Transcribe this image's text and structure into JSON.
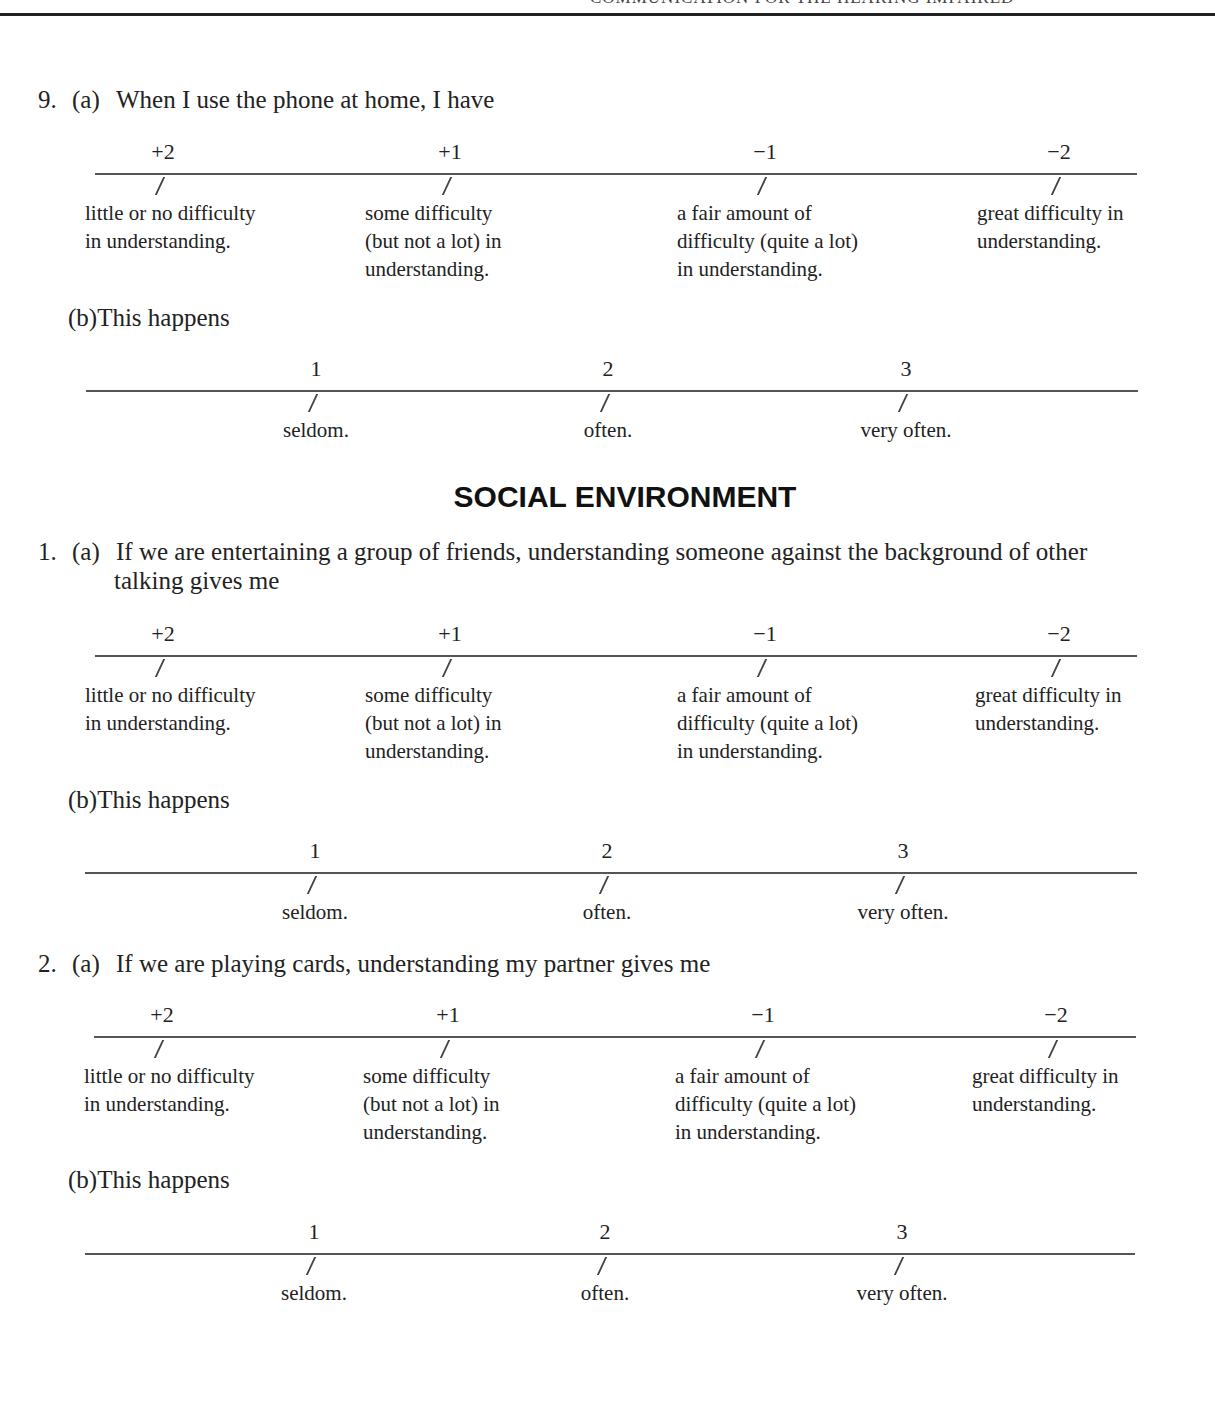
{
  "page": {
    "running_head": "COMMUNICATION FOR THE HEARING IMPAIRED",
    "section_title": "SOCIAL ENVIRONMENT"
  },
  "difficulty_scale": {
    "values": [
      "+2",
      "+1",
      "−1",
      "−2"
    ],
    "labels": [
      [
        "little or no difficulty",
        "in understanding."
      ],
      [
        "some difficulty",
        "(but not a lot) in",
        "understanding."
      ],
      [
        "a fair amount of",
        "difficulty (quite a lot)",
        "in understanding."
      ],
      [
        "great difficulty in",
        "understanding."
      ]
    ]
  },
  "frequency_scale": {
    "values": [
      "1",
      "2",
      "3"
    ],
    "labels": [
      "seldom.",
      "often.",
      "very often."
    ]
  },
  "questions": [
    {
      "number": "9.",
      "part_a": "(a)",
      "text_a": "When I use the phone at home, I have",
      "part_b": "(b)",
      "text_b": "This happens"
    },
    {
      "number": "1.",
      "part_a": "(a)",
      "text_a_line1": "If we are entertaining a group of friends, understanding someone against the background of other",
      "text_a_line2": "talking gives me",
      "part_b": "(b)",
      "text_b": "This happens"
    },
    {
      "number": "2.",
      "part_a": "(a)",
      "text_a": "If we are playing cards, understanding my partner gives me",
      "part_b": "(b)",
      "text_b": "This happens"
    }
  ]
}
